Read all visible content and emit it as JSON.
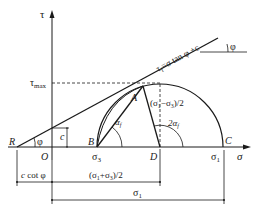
{
  "diagram": {
    "type": "Mohr-Coulomb failure envelope with Mohr circle",
    "axes": {
      "vertical_label": "τ",
      "horizontal_label": "σ",
      "tau_max_label": "τmax"
    },
    "envelope": {
      "equation_prefix": "τ",
      "equation_subscript": "f",
      "equation_suffix": "=σ tan φ +c",
      "angle_label": "φ",
      "angle_label_right": "φ"
    },
    "points": {
      "R": "R",
      "O": "O",
      "A": "A",
      "B": "B",
      "C": "C",
      "D": "D"
    },
    "labels": {
      "cohesion": "c",
      "sigma3": "σ3",
      "sigma1_axis": "σ1",
      "radius": "(σ1−σ3)/2",
      "alpha_f": "αf",
      "two_alpha_f": "2αf"
    },
    "dimensions": {
      "c_cot_phi": "c cot φ",
      "center": "(σ1+σ3)/2",
      "sigma1": "σ1"
    }
  }
}
